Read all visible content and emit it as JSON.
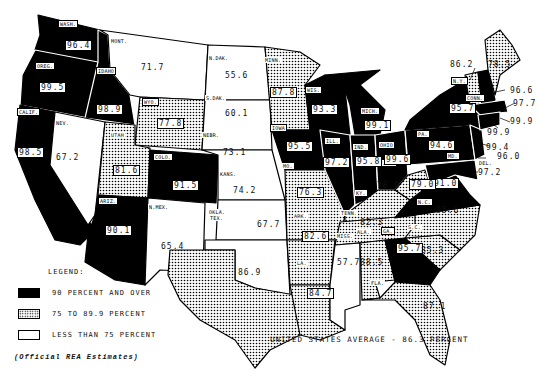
{
  "legend": {
    "title": "LEGEND:",
    "items": [
      {
        "label": "90 PERCENT AND OVER",
        "pattern": "black"
      },
      {
        "label": "75 TO 89.9 PERCENT",
        "pattern": "dots"
      },
      {
        "label": "LESS THAN 75 PERCENT",
        "pattern": "white"
      }
    ]
  },
  "average_text": "UNITED STATES AVERAGE - 86.3 PERCENT",
  "source_text": "(Official REA Estimates)",
  "states": [
    {
      "abbr": "WASH.",
      "value": "96.4",
      "category": "black"
    },
    {
      "abbr": "OREG.",
      "value": "99.5",
      "category": "black"
    },
    {
      "abbr": "IDAHO",
      "value": "98.9",
      "category": "black"
    },
    {
      "abbr": "CALIF.",
      "value": "98.5",
      "category": "black"
    },
    {
      "abbr": "NEV.",
      "value": "67.2",
      "category": "white"
    },
    {
      "abbr": "MONT.",
      "value": "71.7",
      "category": "white"
    },
    {
      "abbr": "WYO.",
      "value": "77.8",
      "category": "dots"
    },
    {
      "abbr": "UTAH",
      "value": "81.6",
      "category": "dots"
    },
    {
      "abbr": "COLO.",
      "value": "91.5",
      "category": "black"
    },
    {
      "abbr": "ARIZ.",
      "value": "90.1",
      "category": "black"
    },
    {
      "abbr": "N.MEX.",
      "value": "65.4",
      "category": "white"
    },
    {
      "abbr": "N.DAK.",
      "value": "55.6",
      "category": "white"
    },
    {
      "abbr": "S.DAK.",
      "value": "60.1",
      "category": "white"
    },
    {
      "abbr": "NEBR.",
      "value": "73.1",
      "category": "white"
    },
    {
      "abbr": "KANS.",
      "value": "74.2",
      "category": "white"
    },
    {
      "abbr": "OKLA.",
      "value": "67.7",
      "category": "white"
    },
    {
      "abbr": "TEX.",
      "value": "86.9",
      "category": "dots"
    },
    {
      "abbr": "MINN.",
      "value": "87.8",
      "category": "dots"
    },
    {
      "abbr": "IOWA",
      "value": "95.5",
      "category": "black"
    },
    {
      "abbr": "MO.",
      "value": "76.3",
      "category": "dots"
    },
    {
      "abbr": "ARK.",
      "value": "82.6",
      "category": "dots"
    },
    {
      "abbr": "LA.",
      "value": "84.7",
      "category": "dots"
    },
    {
      "abbr": "WIS.",
      "value": "93.3",
      "category": "black"
    },
    {
      "abbr": "ILL.",
      "value": "97.2",
      "category": "black"
    },
    {
      "abbr": "MICH.",
      "value": "99.1",
      "category": "black"
    },
    {
      "abbr": "IND.",
      "value": "95.8",
      "category": "black"
    },
    {
      "abbr": "OHIO",
      "value": "99.6",
      "category": "black"
    },
    {
      "abbr": "KY.",
      "value": "78.0",
      "category": "dots"
    },
    {
      "abbr": "TENN.",
      "value": "82.3",
      "category": "dots"
    },
    {
      "abbr": "MISS.",
      "value": "57.7",
      "category": "white"
    },
    {
      "abbr": "ALA.",
      "value": "88.5",
      "category": "dots"
    },
    {
      "abbr": "GA.",
      "value": "95.7",
      "category": "black"
    },
    {
      "abbr": "FLA.",
      "value": "87.1",
      "category": "dots"
    },
    {
      "abbr": "S.C.",
      "value": "85.3",
      "category": "dots"
    },
    {
      "abbr": "N.C.",
      "value": "85.6",
      "category": "dots"
    },
    {
      "abbr": "VA.",
      "value": "91.0",
      "category": "black"
    },
    {
      "abbr": "W.VA.",
      "value": "79.0",
      "category": "dots"
    },
    {
      "abbr": "PA.",
      "value": "94.6",
      "category": "black"
    },
    {
      "abbr": "N.Y.",
      "value": "95.7",
      "category": "black"
    },
    {
      "abbr": "VT.",
      "value": "86.2",
      "category": "dots"
    },
    {
      "abbr": "MAINE",
      "value": "78.5",
      "category": "dots"
    },
    {
      "abbr": "N.H.",
      "value": "96.6",
      "category": "black"
    },
    {
      "abbr": "MASS.",
      "value": "97.7",
      "category": "black"
    },
    {
      "abbr": "R.I.",
      "value": "99.9",
      "category": "black"
    },
    {
      "abbr": "CONN.",
      "value": "99.9",
      "category": "black"
    },
    {
      "abbr": "N.J.",
      "value": "99.4",
      "category": "black"
    },
    {
      "abbr": "DEL.",
      "value": "96.0",
      "category": "black"
    },
    {
      "abbr": "MD.",
      "value": "97.2",
      "category": "black"
    }
  ]
}
